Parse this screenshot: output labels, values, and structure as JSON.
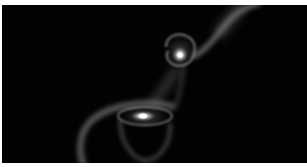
{
  "image": {
    "subject": "interacting galaxies simulation",
    "background_color": "#020202",
    "border_color": "#ffffff",
    "objects": [
      {
        "name": "upper-galaxy",
        "cx": 178,
        "cy": 49,
        "core_color": "#ffffff"
      },
      {
        "name": "lower-galaxy",
        "cx": 141,
        "cy": 111,
        "core_color": "#ffffff"
      },
      {
        "name": "tidal-tail-upper-right",
        "color": "#9a9a9a"
      },
      {
        "name": "tidal-tail-lower-left",
        "color": "#8a8a8a"
      },
      {
        "name": "tidal-bridge",
        "color": "#6a6a6a"
      }
    ]
  }
}
